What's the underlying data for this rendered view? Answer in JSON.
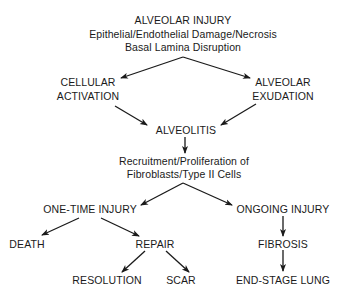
{
  "diagram": {
    "type": "flowchart",
    "nodes": {
      "alveolar_injury": {
        "title": "ALVEOLAR INJURY",
        "line2": "Epithelial/Endothelial Damage/Necrosis",
        "line3": "Basal Lamina Disruption"
      },
      "cellular_activation": {
        "line1": "CELLULAR",
        "line2": "ACTIVATION"
      },
      "alveolar_exudation": {
        "line1": "ALVEOLAR",
        "line2": "EXUDATION"
      },
      "alveolitis": {
        "label": "ALVEOLITIS"
      },
      "recruitment": {
        "line1": "Recruitment/Proliferation of",
        "line2": "Fibroblasts/Type II Cells"
      },
      "one_time_injury": {
        "label": "ONE-TIME INJURY"
      },
      "ongoing_injury": {
        "label": "ONGOING INJURY"
      },
      "death": {
        "label": "DEATH"
      },
      "repair": {
        "label": "REPAIR"
      },
      "fibrosis": {
        "label": "FIBROSIS"
      },
      "resolution": {
        "label": "RESOLUTION"
      },
      "scar": {
        "label": "SCAR"
      },
      "end_stage_lung": {
        "label": "END-STAGE LUNG"
      }
    },
    "edges": [
      {
        "from": "alveolar_injury",
        "to": "cellular_activation"
      },
      {
        "from": "alveolar_injury",
        "to": "alveolar_exudation"
      },
      {
        "from": "cellular_activation",
        "to": "alveolitis"
      },
      {
        "from": "alveolar_exudation",
        "to": "alveolitis"
      },
      {
        "from": "alveolitis",
        "to": "recruitment"
      },
      {
        "from": "recruitment",
        "to": "one_time_injury"
      },
      {
        "from": "recruitment",
        "to": "ongoing_injury"
      },
      {
        "from": "one_time_injury",
        "to": "death"
      },
      {
        "from": "one_time_injury",
        "to": "repair"
      },
      {
        "from": "repair",
        "to": "resolution"
      },
      {
        "from": "repair",
        "to": "scar"
      },
      {
        "from": "ongoing_injury",
        "to": "fibrosis"
      },
      {
        "from": "fibrosis",
        "to": "end_stage_lung"
      }
    ],
    "colors": {
      "ink": "#1a1a1a",
      "background": "#ffffff"
    }
  }
}
